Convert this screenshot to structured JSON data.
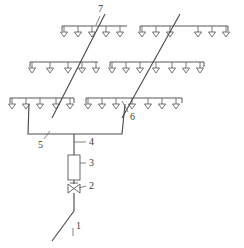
{
  "figure": {
    "type": "engineering-line-diagram",
    "background_color": "#ffffff",
    "line_color": "#58585a",
    "label_color": "#3a3a3c"
  },
  "callouts": [
    {
      "id": "c1",
      "label": "1",
      "refers_to": "water supply inlet pipe",
      "x": 76,
      "y": 226
    },
    {
      "id": "c2",
      "label": "2",
      "refers_to": "control valve",
      "x": 89,
      "y": 182
    },
    {
      "id": "c3",
      "label": "3",
      "refers_to": "filter",
      "x": 89,
      "y": 160
    },
    {
      "id": "c4",
      "label": "4",
      "refers_to": "main riser pipe",
      "x": 89,
      "y": 141
    },
    {
      "id": "c5",
      "label": "5",
      "refers_to": "distribution manifold header",
      "x": 39,
      "y": 142
    },
    {
      "id": "c6",
      "label": "6",
      "refers_to": "branch riser",
      "x": 130,
      "y": 115
    },
    {
      "id": "c7",
      "label": "7",
      "refers_to": "lateral supply line",
      "x": 98,
      "y": 8
    }
  ],
  "laterals": [
    {
      "name": "row-1-left",
      "row": 1,
      "y": 26,
      "x_start": 62,
      "x_end": 127,
      "sprinkler_count": 5,
      "sprinkler_x": [
        64,
        78,
        92,
        106,
        120
      ]
    },
    {
      "name": "row-1-right",
      "row": 1,
      "y": 26,
      "x_start": 140,
      "x_end": 228,
      "sprinkler_count": 6,
      "sprinkler_x": [
        142,
        156,
        170,
        198,
        212,
        226
      ]
    },
    {
      "name": "row-2-left",
      "row": 2,
      "y": 62,
      "x_start": 30,
      "x_end": 98,
      "sprinkler_count": 5,
      "sprinkler_x": [
        32,
        50,
        68,
        82,
        96
      ]
    },
    {
      "name": "row-2-right",
      "row": 2,
      "y": 62,
      "x_start": 110,
      "x_end": 204,
      "sprinkler_count": 7,
      "sprinkler_x": [
        112,
        126,
        140,
        156,
        172,
        186,
        200
      ]
    },
    {
      "name": "row-3-left",
      "row": 3,
      "y": 98,
      "x_start": 10,
      "x_end": 74,
      "sprinkler_count": 5,
      "sprinkler_x": [
        12,
        26,
        40,
        56,
        70
      ]
    },
    {
      "name": "row-3-right",
      "row": 3,
      "y": 98,
      "x_start": 86,
      "x_end": 182,
      "sprinkler_count": 7,
      "sprinkler_x": [
        88,
        102,
        116,
        132,
        148,
        162,
        176
      ]
    }
  ],
  "manifold": {
    "name": "distribution-header",
    "left_top_x": 29,
    "right_top_x": 125,
    "left_bottom_x": 28,
    "right_bottom_x": 122,
    "top_y": 104,
    "bottom_y": 134,
    "outlet_x": 74
  },
  "supply_train": {
    "riser_top_y": 134,
    "riser_bottom_y": 211,
    "riser_x": 74,
    "filter": {
      "x": 68,
      "y": 155,
      "width": 12,
      "height": 25
    },
    "valve": {
      "x": 74,
      "y": 188,
      "size": 9
    },
    "inlet_bend_x": 74,
    "inlet_bend_y": 211,
    "inlet_end_x": 52,
    "inlet_end_y": 241
  },
  "diagonals": [
    {
      "name": "lateral-line-7",
      "x1": 52,
      "x2": 105,
      "y1": 118,
      "y2": 14
    },
    {
      "name": "lateral-line-6",
      "x1": 122,
      "x2": 180,
      "y1": 118,
      "y2": 14
    }
  ]
}
